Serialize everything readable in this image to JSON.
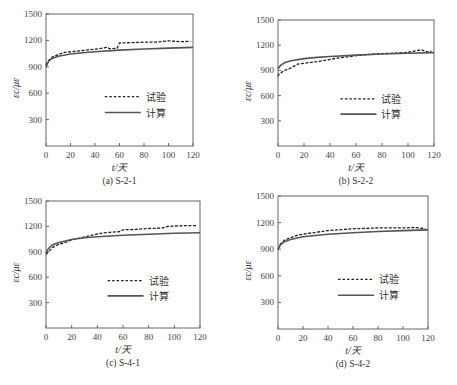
{
  "figure_caption": "",
  "legend": {
    "experiment": "试验",
    "calculated": "计算"
  },
  "axis": {
    "xlabel": "t/天",
    "ylabel": "εc/με",
    "xticks": [
      0,
      20,
      40,
      60,
      80,
      100,
      120
    ],
    "yticks": [
      300,
      600,
      900,
      1200,
      1500
    ]
  },
  "panels": [
    {
      "id": "a",
      "caption": "(a)  S-2-1"
    },
    {
      "id": "b",
      "caption": "(b)  S-2-2"
    },
    {
      "id": "c",
      "caption": "(c)  S-4-1"
    },
    {
      "id": "d",
      "caption": "(d)  S-4-2"
    }
  ],
  "chart_data": [
    {
      "type": "line",
      "title": "(a) S-2-1",
      "xlabel": "t/天",
      "ylabel": "εc/με",
      "xlim": [
        0,
        120
      ],
      "ylim": [
        0,
        1500
      ],
      "grid": false,
      "legend_position": "center-right",
      "series": [
        {
          "name": "试验",
          "style": "dashed",
          "x": [
            0,
            2,
            5,
            10,
            15,
            20,
            30,
            40,
            45,
            50,
            52,
            58,
            60,
            70,
            80,
            90,
            100,
            110,
            118
          ],
          "y": [
            920,
            970,
            1010,
            1040,
            1065,
            1070,
            1085,
            1100,
            1110,
            1120,
            1105,
            1110,
            1170,
            1175,
            1180,
            1180,
            1195,
            1185,
            1190
          ]
        },
        {
          "name": "计算",
          "style": "solid",
          "x": [
            0,
            2,
            5,
            10,
            20,
            30,
            40,
            60,
            80,
            100,
            120
          ],
          "y": [
            900,
            960,
            995,
            1020,
            1045,
            1060,
            1072,
            1090,
            1102,
            1112,
            1120
          ]
        }
      ]
    },
    {
      "type": "line",
      "title": "(b) S-2-2",
      "xlabel": "t/天",
      "ylabel": "εc/με",
      "xlim": [
        0,
        120
      ],
      "ylim": [
        0,
        1500
      ],
      "grid": false,
      "legend_position": "center-right",
      "series": [
        {
          "name": "试验",
          "style": "dashed",
          "x": [
            0,
            1,
            3,
            5,
            10,
            15,
            20,
            30,
            40,
            45,
            50,
            60,
            70,
            80,
            90,
            100,
            110,
            115,
            118
          ],
          "y": [
            830,
            860,
            880,
            900,
            930,
            975,
            985,
            1005,
            1030,
            1045,
            1055,
            1075,
            1090,
            1100,
            1105,
            1115,
            1145,
            1120,
            1130
          ]
        },
        {
          "name": "计算",
          "style": "solid",
          "x": [
            0,
            2,
            5,
            10,
            20,
            30,
            40,
            60,
            80,
            100,
            120
          ],
          "y": [
            920,
            960,
            990,
            1015,
            1040,
            1055,
            1065,
            1082,
            1095,
            1105,
            1112
          ]
        }
      ]
    },
    {
      "type": "line",
      "title": "(c) S-4-1",
      "xlabel": "t/天",
      "ylabel": "εc/με",
      "xlim": [
        0,
        120
      ],
      "ylim": [
        0,
        1500
      ],
      "grid": false,
      "legend_position": "center-right",
      "series": [
        {
          "name": "试验",
          "style": "dashed",
          "x": [
            0,
            2,
            5,
            10,
            15,
            20,
            30,
            40,
            45,
            50,
            55,
            58,
            60,
            70,
            80,
            90,
            95,
            100,
            110,
            118
          ],
          "y": [
            870,
            900,
            950,
            990,
            1010,
            1040,
            1075,
            1110,
            1125,
            1130,
            1135,
            1140,
            1160,
            1165,
            1175,
            1180,
            1200,
            1205,
            1210,
            1210
          ]
        },
        {
          "name": "计算",
          "style": "solid",
          "x": [
            0,
            2,
            5,
            10,
            20,
            30,
            40,
            60,
            80,
            100,
            120
          ],
          "y": [
            890,
            940,
            980,
            1010,
            1045,
            1065,
            1078,
            1095,
            1108,
            1118,
            1125
          ]
        }
      ]
    },
    {
      "type": "line",
      "title": "(d) S-4-2",
      "xlabel": "t/天",
      "ylabel": "εc/με",
      "xlim": [
        0,
        120
      ],
      "ylim": [
        0,
        1500
      ],
      "grid": false,
      "legend_position": "center-right",
      "series": [
        {
          "name": "试验",
          "style": "dashed",
          "x": [
            0,
            2,
            5,
            10,
            15,
            20,
            30,
            40,
            50,
            60,
            70,
            80,
            90,
            100,
            110,
            118
          ],
          "y": [
            900,
            960,
            1000,
            1030,
            1055,
            1070,
            1090,
            1110,
            1120,
            1130,
            1135,
            1140,
            1140,
            1140,
            1145,
            1130
          ]
        },
        {
          "name": "计算",
          "style": "solid",
          "x": [
            0,
            2,
            5,
            10,
            20,
            30,
            40,
            60,
            80,
            100,
            120
          ],
          "y": [
            900,
            950,
            985,
            1010,
            1040,
            1055,
            1068,
            1085,
            1100,
            1110,
            1118
          ]
        }
      ]
    }
  ]
}
